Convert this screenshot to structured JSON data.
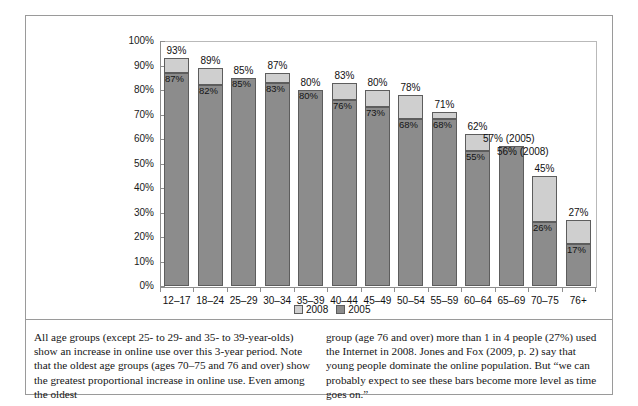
{
  "chart_data": {
    "type": "bar",
    "title": "",
    "subtitle": "",
    "xlabel": "",
    "ylabel": "",
    "ylim": [
      0,
      100
    ],
    "grid": false,
    "stacked": true,
    "legend_position": "bottom-center",
    "categories": [
      "12–17",
      "18–24",
      "25–29",
      "30–34",
      "35–39",
      "40–44",
      "45–49",
      "50–54",
      "55–59",
      "60–64",
      "65–69",
      "70–75",
      "76+"
    ],
    "ytick_labels": [
      "100%",
      "90%",
      "80%",
      "70%",
      "60%",
      "50%",
      "40%",
      "30%",
      "20%",
      "10%",
      "0%"
    ],
    "ytick_values": [
      100,
      90,
      80,
      70,
      60,
      50,
      40,
      30,
      20,
      10,
      0
    ],
    "series": [
      {
        "name": "2005",
        "color": "#8c8c8c",
        "values": [
          87,
          82,
          85,
          83,
          80,
          76,
          73,
          68,
          68,
          55,
          57,
          26,
          17
        ],
        "labels": [
          "87%",
          "82%",
          "85%",
          "83%",
          "80%",
          "76%",
          "73%",
          "68%",
          "68%",
          "55%",
          "",
          "26%",
          "17%"
        ]
      },
      {
        "name": "2008",
        "color": "#cfcfcf",
        "values": [
          93,
          89,
          85,
          87,
          80,
          83,
          80,
          78,
          71,
          62,
          56,
          45,
          27
        ],
        "labels": [
          "93%",
          "89%",
          "85%",
          "87%",
          "80%",
          "83%",
          "80%",
          "78%",
          "71%",
          "62%",
          "",
          "45%",
          "27%"
        ]
      }
    ],
    "top_labels": [
      "93%",
      "89%",
      "85%",
      "87%",
      "80%",
      "83%",
      "80%",
      "78%",
      "71%",
      "62%",
      "57% (2005)",
      "45%",
      "27%"
    ],
    "extra_labels": [
      {
        "category": "65–69",
        "text": "56% (2008)"
      }
    ],
    "legend": [
      {
        "label": "2008",
        "color": "#cfcfcf"
      },
      {
        "label": "2005",
        "color": "#8c8c8c"
      }
    ]
  },
  "caption": {
    "left": "All age groups (except 25- to 29- and 35- to 39-year-olds) show an increase in online use over this 3-year period. Note that the oldest age groups (ages 70–75 and 76 and over) show the greatest proportional increase in online use. Even among the oldest",
    "right": "group (age 76 and over) more than 1 in 4 people (27%) used the Internet in 2008. Jones and Fox (2009, p. 2) say that young people dominate the online population. But “we can probably expect to see these bars become more level as time goes on.”"
  }
}
